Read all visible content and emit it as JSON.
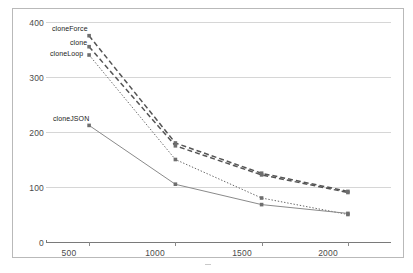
{
  "chart_data": {
    "type": "line",
    "title": "",
    "subtitle": "",
    "xlabel": "",
    "ylabel": "",
    "x": [
      500,
      1000,
      1500,
      2000
    ],
    "xlim": [
      250,
      2250
    ],
    "ylim": [
      0,
      400
    ],
    "yticks": [
      0,
      100,
      200,
      300,
      400
    ],
    "xticks": [
      500,
      1000,
      1500,
      2000
    ],
    "grid": true,
    "legend": "inline-labels-at-first-point",
    "series": [
      {
        "name": "cloneForce",
        "values": [
          375,
          180,
          125,
          92
        ],
        "style": "dashed",
        "color": "#555555"
      },
      {
        "name": "clone",
        "values": [
          355,
          175,
          122,
          90
        ],
        "style": "dashed",
        "color": "#555555"
      },
      {
        "name": "cloneLoop",
        "values": [
          340,
          150,
          80,
          50
        ],
        "style": "dotted",
        "color": "#666666"
      },
      {
        "name": "cloneJSON",
        "values": [
          212,
          105,
          68,
          52
        ],
        "style": "solid",
        "color": "#8a8a8a"
      }
    ]
  },
  "axis": {
    "ytick_labels": [
      "400",
      "300",
      "200",
      "100",
      "0"
    ],
    "xtick_labels": [
      "500",
      "1000",
      "1500",
      "2000"
    ]
  },
  "labels": {
    "cloneForce": "cloneForce",
    "clone": "clone",
    "cloneLoop": "cloneLoop",
    "cloneJSON": "cloneJSON"
  },
  "colors": {
    "grid": "#d6d6d6",
    "axis": "#7a7a7a",
    "frame": "#b9b9b9",
    "text": "#4a4a4a",
    "background": "#ffffff"
  }
}
